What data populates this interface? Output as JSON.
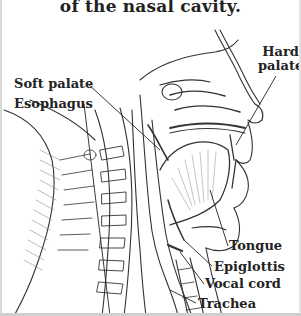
{
  "figure": {
    "title_fragment": "of the nasal cavity.",
    "labels": {
      "hard_palate_line1": "Hard",
      "hard_palate_line2": "palate",
      "soft_palate": "Soft palate",
      "esophagus": "Esophagus",
      "tongue": "Tongue",
      "epiglottis": "Epiglottis",
      "vocal_cord": "Vocal cord",
      "trachea": "Trachea"
    },
    "colors": {
      "ink": "#222222",
      "background": "#ffffff",
      "hatch": "#555555"
    }
  }
}
